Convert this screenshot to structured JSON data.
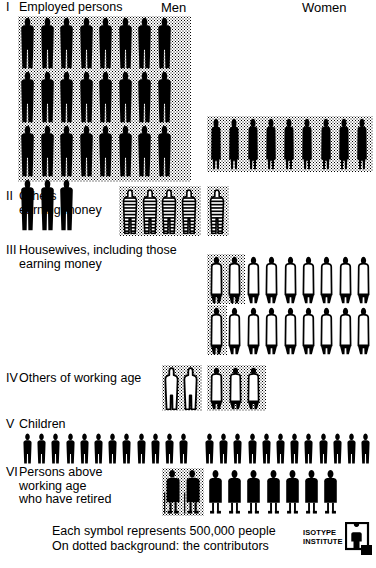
{
  "columns": {
    "men": "Men",
    "women": "Women"
  },
  "rows": [
    {
      "numeral": "I",
      "label": "Employed persons",
      "men": {
        "count": 27,
        "rows": 3,
        "per_row": 9,
        "style": "solid-male",
        "dotted": true
      },
      "women": {
        "count": 9,
        "rows": 1,
        "per_row": 9,
        "style": "solid-female",
        "dotted": true
      }
    },
    {
      "numeral": "II",
      "label": "Others\nearning money",
      "men": {
        "count": 4,
        "rows": 1,
        "per_row": 4,
        "style": "striped",
        "dotted": true
      },
      "women": {
        "count": 1,
        "rows": 1,
        "per_row": 1,
        "style": "striped",
        "dotted": true
      }
    },
    {
      "numeral": "III",
      "label": "Housewives, including those\nearning money",
      "men": {
        "count": 0,
        "rows": 0,
        "per_row": 0,
        "style": "none",
        "dotted": false
      },
      "women": {
        "count": 18,
        "rows": 2,
        "per_row": 9,
        "style": "outline-female",
        "dotted_first": [
          2,
          1
        ]
      }
    },
    {
      "numeral": "IV",
      "label": "Others of working age",
      "men": {
        "count": 2,
        "rows": 1,
        "per_row": 2,
        "style": "outline-male",
        "dotted": true
      },
      "women": {
        "count": 3,
        "rows": 1,
        "per_row": 3,
        "style": "outline-female",
        "dotted": true
      }
    },
    {
      "numeral": "V",
      "label": "Children",
      "men": {
        "count": 12,
        "rows": 1,
        "per_row": 12,
        "style": "solid-child",
        "dotted": false
      },
      "women": {
        "count": 12,
        "rows": 1,
        "per_row": 12,
        "style": "solid-child",
        "dotted": false
      }
    },
    {
      "numeral": "VI",
      "label": "Persons above\nworking age\nwho have retired",
      "men": {
        "count": 2,
        "rows": 1,
        "per_row": 2,
        "style": "solid-cane",
        "dotted": true
      },
      "women": {
        "count": 7,
        "rows": 1,
        "per_row": 7,
        "style": "solid-elder",
        "dotted": false
      }
    }
  ],
  "caption": {
    "line1": "Each symbol represents 500,000 people",
    "line2": "On dotted background: the contributors"
  },
  "logo": {
    "line1": "ISOTYPE",
    "line2": "INSTITUTE"
  },
  "chart_data": {
    "type": "pictogram",
    "unit_value": 500000,
    "unit_label": "Each symbol represents 500,000 people",
    "note": "On dotted background: the contributors",
    "categories": [
      "I Employed persons",
      "II Others earning money",
      "III Housewives, including those earning money",
      "IV Others of working age",
      "V Children",
      "VI Persons above working age who have retired"
    ],
    "series": [
      {
        "name": "Men",
        "symbol_counts": [
          27,
          4,
          0,
          2,
          12,
          2
        ],
        "values": [
          13500000,
          2000000,
          0,
          1000000,
          6000000,
          1000000
        ]
      },
      {
        "name": "Women",
        "symbol_counts": [
          9,
          1,
          18,
          3,
          12,
          7
        ],
        "values": [
          4500000,
          500000,
          9000000,
          1500000,
          6000000,
          3500000
        ]
      }
    ],
    "contributors_on_dotted_background": {
      "Men": [
        27,
        4,
        0,
        2,
        0,
        2
      ],
      "Women": [
        9,
        1,
        3,
        3,
        0,
        0
      ]
    },
    "legend_position": "top",
    "grid": false
  }
}
